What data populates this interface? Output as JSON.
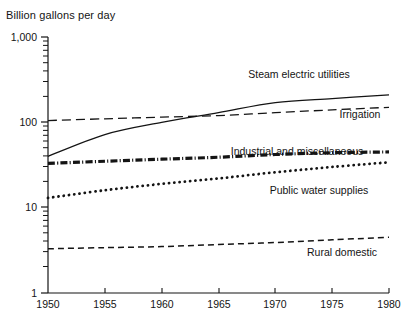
{
  "chart_data": {
    "type": "line",
    "title": "",
    "ylabel": "Billion gallons per day",
    "xlabel": "",
    "yscale": "log",
    "ylim": [
      1,
      1000
    ],
    "xlim": [
      1950,
      1980
    ],
    "grid": false,
    "legend_position": "inline-right",
    "x": [
      1950,
      1955,
      1960,
      1965,
      1970,
      1975,
      1980
    ],
    "xticklabels": [
      "1950",
      "1955",
      "1960",
      "1965",
      "1970",
      "1975",
      "1980"
    ],
    "yticklabels": [
      "1",
      "10",
      "100",
      "1,000"
    ],
    "ytickvalues": [
      1,
      10,
      100,
      1000
    ],
    "series": [
      {
        "name": "Steam electric utilities",
        "style": "solid",
        "values": [
          40,
          72,
          100,
          130,
          170,
          190,
          210
        ]
      },
      {
        "name": "Irrigation",
        "style": "dashed",
        "values": [
          105,
          110,
          115,
          120,
          130,
          140,
          150
        ]
      },
      {
        "name": "Industrial and miscellaneous",
        "style": "dash-dot-thick",
        "values": [
          33,
          35,
          37,
          39,
          42,
          44,
          45
        ]
      },
      {
        "name": "Public water supplies",
        "style": "dotted",
        "values": [
          13,
          16,
          19,
          22,
          26,
          30,
          34
        ]
      },
      {
        "name": "Rural domestic",
        "style": "dashed-thin",
        "values": [
          3.3,
          3.4,
          3.5,
          3.7,
          3.9,
          4.2,
          4.5
        ]
      }
    ]
  },
  "labels": {
    "steam_electric": "Steam electric utilities",
    "irrigation": "Irrigation",
    "industrial": "Industrial and miscellaneous",
    "public_water": "Public water supplies",
    "rural_domestic": "Rural domestic"
  },
  "axis": {
    "y_title": "Billion gallons per day",
    "y_1000": "1,000",
    "y_100": "100",
    "y_10": "10",
    "y_1": "1",
    "x_1950": "1950",
    "x_1955": "1955",
    "x_1960": "1960",
    "x_1965": "1965",
    "x_1970": "1970",
    "x_1975": "1975",
    "x_1980": "1980"
  },
  "colors": {
    "ink": "#141414",
    "background": "#ffffff"
  }
}
